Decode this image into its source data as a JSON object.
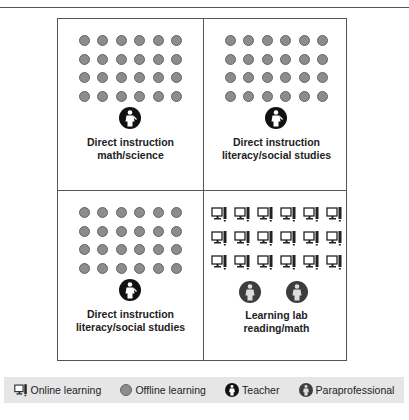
{
  "quadrants": [
    {
      "id": "top-left",
      "type": "students",
      "icon": "offline-learning-dot",
      "count": 24,
      "columns": 6,
      "rows": 4,
      "staff": [
        "teacher"
      ],
      "label_line1": "Direct instruction",
      "label_line2": "math/science"
    },
    {
      "id": "top-right",
      "type": "students",
      "icon": "offline-learning-dot",
      "count": 24,
      "columns": 6,
      "rows": 4,
      "staff": [
        "teacher"
      ],
      "label_line1": "Direct instruction",
      "label_line2": "literacy/social studies"
    },
    {
      "id": "bottom-left",
      "type": "students",
      "icon": "offline-learning-dot",
      "count": 24,
      "columns": 6,
      "rows": 4,
      "staff": [
        "teacher"
      ],
      "label_line1": "Direct instruction",
      "label_line2": "literacy/social studies"
    },
    {
      "id": "bottom-right",
      "type": "computers",
      "icon": "online-learning-computer",
      "count": 18,
      "columns": 6,
      "rows": 3,
      "staff": [
        "paraprofessional",
        "paraprofessional"
      ],
      "label_line1": "Learning lab",
      "label_line2": "reading/math"
    }
  ],
  "legend": {
    "items": [
      {
        "icon": "computer-icon",
        "label": "Online learning"
      },
      {
        "icon": "gray-dot-icon",
        "label": "Offline learning"
      },
      {
        "icon": "teacher-icon",
        "label": "Teacher"
      },
      {
        "icon": "paraprofessional-icon",
        "label": "Paraprofessional"
      }
    ]
  },
  "colors": {
    "dot": "#8c8c8c",
    "teacher": "#111111",
    "paraprofessional": "#3d3d3d",
    "legend_bg": "#e6e6e6",
    "lines": "#555555"
  }
}
